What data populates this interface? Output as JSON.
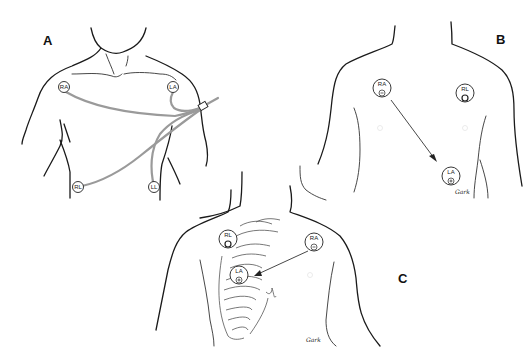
{
  "figure": {
    "panels": [
      {
        "id": "A",
        "label": "A",
        "electrodes": [
          {
            "name": "RA",
            "text": "RA"
          },
          {
            "name": "LA",
            "text": "LA"
          },
          {
            "name": "RL",
            "text": "RL"
          },
          {
            "name": "LL",
            "text": "LL"
          }
        ],
        "description": "Limb-lead electrode placement on torso with cables joined into trunk cable"
      },
      {
        "id": "B",
        "label": "B",
        "electrodes": [
          {
            "name": "RA",
            "text": "RA",
            "polarity": "−"
          },
          {
            "name": "RL",
            "text": "RL",
            "polarity": "ground"
          },
          {
            "name": "LA",
            "text": "LA",
            "polarity": "+"
          }
        ],
        "arrow": "RA to LA",
        "signature": "Gark"
      },
      {
        "id": "C",
        "label": "C",
        "electrodes": [
          {
            "name": "RL",
            "text": "RL",
            "polarity": "ground"
          },
          {
            "name": "RA",
            "text": "RA",
            "polarity": "−"
          },
          {
            "name": "LA",
            "text": "LA",
            "polarity": "+"
          }
        ],
        "arrow": "RA to LA",
        "signature": "Gark"
      }
    ],
    "colors": {
      "line": "#1a1a1a",
      "cable": "#9a9a9a",
      "background": "#ffffff"
    }
  }
}
